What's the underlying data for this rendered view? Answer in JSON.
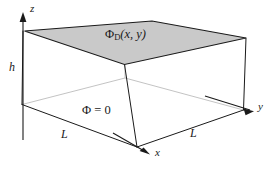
{
  "figure": {
    "name": "dirichlet-box-diagram",
    "colors": {
      "line": "#1a1a1a",
      "hidden_line": "#b0b0b0",
      "top_face_fill": "#c9c9c9",
      "background": "#ffffff"
    },
    "axes": [
      {
        "id": "z",
        "label": "z",
        "direction": "up"
      },
      {
        "id": "y",
        "label": "y",
        "direction": "right-down"
      },
      {
        "id": "x",
        "label": "x",
        "direction": "front-down-right"
      }
    ],
    "dimensions": [
      {
        "id": "height",
        "label": "h",
        "edge": "vertical-left"
      },
      {
        "id": "depth",
        "label": "L",
        "edge": "bottom-left"
      },
      {
        "id": "width",
        "label": "L",
        "edge": "bottom-right"
      }
    ],
    "boundary_conditions": {
      "top_face": {
        "symbol": "Φ",
        "subscript": "D",
        "arguments": "(x, y)",
        "full_label": "ΦD(x, y)"
      },
      "other_faces": {
        "full_label": "Φ = 0",
        "symbol": "Φ",
        "value": "0"
      }
    }
  }
}
